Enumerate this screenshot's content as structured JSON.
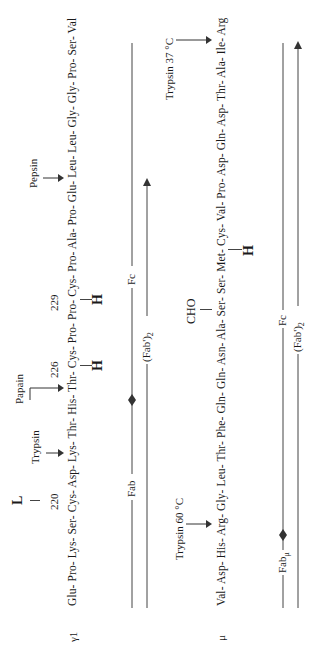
{
  "figure": {
    "orientation": "rotated 90 degrees counter-clockwise",
    "gamma1": {
      "chain_label": "γ1",
      "sequence": "Glu- Pro- Lys- Ser- Cys- Asp- Lys- Thr- His- Thr- Cys- Pro- Pro- Cys- Pro- Ala- Pro- Glu- Leu- Leu- Gly- Gly- Pro- Ser- Val",
      "residue_numbers": [
        "220",
        "226",
        "229"
      ],
      "light_chain_label": "L",
      "heavy_labels": [
        "H",
        "H"
      ],
      "cleavage_sites": [
        {
          "enzyme": "Trypsin",
          "after": "Lys"
        },
        {
          "enzyme": "Papain",
          "after": "His"
        },
        {
          "enzyme": "Pepsin",
          "after": "Leu"
        }
      ],
      "fragments": {
        "fab": "Fab",
        "fc": "Fc",
        "fab2": "(Fab')",
        "fab2_sub": "2"
      }
    },
    "mu": {
      "chain_label": "μ",
      "sequence": "Val- Asp- His- Arg- Gly- Leu- Thr- Phe- Gln- Gln- Asn- Ala- Ser- Ser- Met- Cys- Val- Pro- Asp- Gln- Asp- Thr- Ala- Ile- Arg",
      "carbohydrate_label": "CHO",
      "heavy_label": "H",
      "cleavage_sites": [
        {
          "enzyme": "Trypsin 60 °C",
          "after": "Arg"
        },
        {
          "enzyme": "Trypsin 37 °C",
          "after": "Arg (terminal)"
        }
      ],
      "fragments": {
        "fab": "Fab",
        "fab_sub": "μ",
        "fc": "Fc",
        "fab2": "(Fab')",
        "fab2_sub": "2"
      }
    }
  },
  "colors": {
    "ink": "#1a1a1a",
    "line": "#444444",
    "background": "#ffffff"
  }
}
